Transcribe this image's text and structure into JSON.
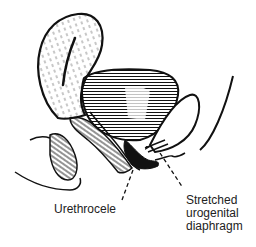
{
  "figure": {
    "colors": {
      "ink": "#111111",
      "paper": "#ffffff",
      "text": "#222222"
    }
  },
  "labels": {
    "urethrocele": "Urethrocele",
    "diaphragm_line1": "Stretched",
    "diaphragm_line2": "urogenital",
    "diaphragm_line3": "diaphragm"
  }
}
